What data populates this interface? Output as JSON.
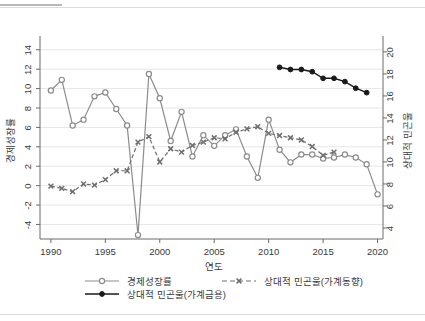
{
  "top_partial_text": "· ·· · · · ···",
  "chart_data": {
    "type": "line",
    "title": "",
    "xlabel": "연도",
    "ylabel": "경제성장률",
    "y2label": "상대적 민곤울",
    "grid": true,
    "legend_position": "bottom",
    "xlim": [
      1989,
      2020.5
    ],
    "ylim": [
      -5.5,
      14.8
    ],
    "y2lim": [
      3.0,
      20.9
    ],
    "xticks": [
      1990,
      1995,
      2000,
      2005,
      2010,
      2015,
      2020
    ],
    "xtick_labels": [
      "1990",
      "1995",
      "2000",
      "2005",
      "2010",
      "2015",
      "2020"
    ],
    "yticks": [
      -4,
      -2,
      0,
      2,
      4,
      6,
      8,
      10,
      12,
      14
    ],
    "ytick_labels": [
      "-4",
      "-2",
      "0",
      "2",
      "4",
      "6",
      "8",
      "10",
      "12",
      "14"
    ],
    "y2ticks": [
      4,
      6,
      8,
      10,
      12,
      14,
      16,
      18,
      20
    ],
    "y2tick_labels": [
      "4",
      "6",
      "8",
      "10",
      "12",
      "14",
      "16",
      "18",
      "20"
    ],
    "series": [
      {
        "name": "경제성장률",
        "axis": "left",
        "color": "#8c8c8c",
        "marker": "open-circle",
        "dash": "none",
        "x": [
          1990,
          1991,
          1992,
          1993,
          1994,
          1995,
          1996,
          1997,
          1998,
          1999,
          2000,
          2001,
          2002,
          2003,
          2004,
          2005,
          2006,
          2007,
          2008,
          2009,
          2010,
          2011,
          2012,
          2013,
          2014,
          2015,
          2016,
          2017,
          2018,
          2019,
          2020
        ],
        "y": [
          9.8,
          10.9,
          6.2,
          6.8,
          9.2,
          9.6,
          7.9,
          6.2,
          -5.1,
          11.5,
          9.0,
          4.6,
          7.6,
          3.0,
          5.2,
          4.1,
          5.2,
          5.8,
          3.0,
          0.8,
          6.8,
          3.7,
          2.4,
          3.2,
          3.2,
          2.8,
          2.9,
          3.2,
          2.9,
          2.2,
          -0.9
        ]
      },
      {
        "name": "상대적 민곤울(가계동향)",
        "axis": "right",
        "color": "#6e6e6e",
        "marker": "x",
        "dash": "dashed",
        "x": [
          1990,
          1991,
          1992,
          1993,
          1994,
          1995,
          1996,
          1997,
          1998,
          1999,
          2000,
          2001,
          2002,
          2003,
          2004,
          2005,
          2006,
          2007,
          2008,
          2009,
          2010,
          2011,
          2012,
          2013,
          2014,
          2015,
          2016
        ],
        "y": [
          7.8,
          7.6,
          7.3,
          8.0,
          7.9,
          8.4,
          9.2,
          9.2,
          11.8,
          12.3,
          10.0,
          11.2,
          10.9,
          11.5,
          11.8,
          12.2,
          12.1,
          12.7,
          13.0,
          13.2,
          12.6,
          12.4,
          12.2,
          12.0,
          11.4,
          10.6,
          10.9
        ]
      },
      {
        "name": "상대적 민곤울(가계금용)",
        "axis": "right",
        "color": "#1a1a1a",
        "marker": "filled-circle",
        "dash": "none",
        "x": [
          2011,
          2012,
          2013,
          2014,
          2015,
          2016,
          2017,
          2018,
          2019
        ],
        "y": [
          18.6,
          18.4,
          18.4,
          18.2,
          17.6,
          17.6,
          17.3,
          16.7,
          16.3
        ]
      }
    ],
    "legend": [
      {
        "label": "경제성장률",
        "marker": "open-circle",
        "dash": "none",
        "color": "#8c8c8c"
      },
      {
        "label": "상대적 민곤울(가계동향)",
        "marker": "x",
        "dash": "dashed",
        "color": "#6e6e6e"
      },
      {
        "label": "상대적 민곤울(가계금용)",
        "marker": "filled-circle",
        "dash": "none",
        "color": "#1a1a1a"
      }
    ]
  }
}
